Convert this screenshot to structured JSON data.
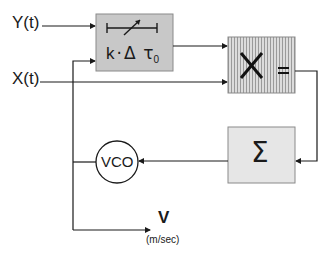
{
  "diagram": {
    "inputs": {
      "y": "Y(t)",
      "x": "X(t)"
    },
    "delay_block": {
      "label": "k·Δ τ₀",
      "k": "k",
      "dot": "·",
      "delta": "Δ",
      "tau": "τ",
      "sub": "0",
      "icon": "variable-delay-icon",
      "fill": "#c8c8c8"
    },
    "multiplier_block": {
      "symbol": "×",
      "equals": "=",
      "fill": "#d4d4d4",
      "pattern": "vertical-stripes"
    },
    "summer_block": {
      "symbol": "Σ",
      "fill": "#e6e6e6"
    },
    "vco": {
      "label": "VCO"
    },
    "output": {
      "label": "V",
      "unit": "(m/sec)"
    },
    "colors": {
      "line": "#1a1a1a",
      "delay_fill": "#c8c8c8",
      "mult_fill": "#d4d4d4",
      "sum_fill": "#e6e6e6"
    }
  }
}
